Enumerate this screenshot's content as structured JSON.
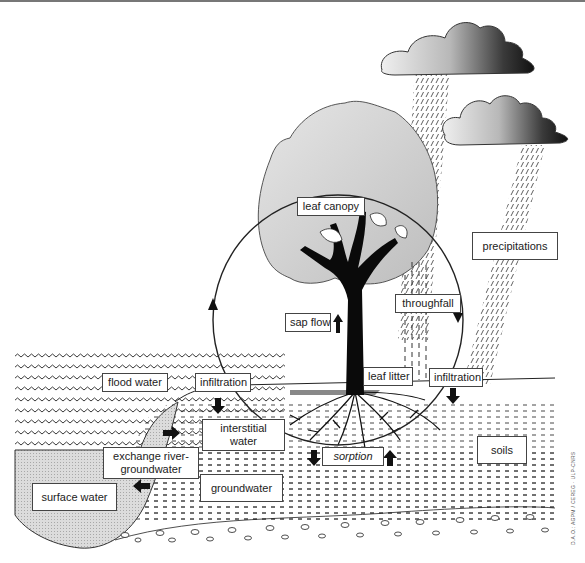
{
  "diagram": {
    "colors": {
      "ink": "#111111",
      "canopy_gray": "#d6d6d6",
      "surface_water_gray": "#d8d8d8",
      "cloud_light": "#e0e0e0",
      "cloud_dark": "#2a2a2a",
      "background": "#ffffff"
    },
    "labels": {
      "leaf_canopy": "leaf canopy",
      "precipitations": "precipitations",
      "throughfall": "throughfall",
      "sap_flow": "sap flow",
      "flood_water": "flood water",
      "infiltration_left": "infiltration",
      "infiltration_right": "infiltration",
      "leaf_litter": "leaf litter",
      "interstitial_water": "interstitial water",
      "exchange_river_groundwater": "exchange river-groundwater",
      "sorption": "sorption",
      "soils": "soils",
      "surface_water": "surface water",
      "groundwater": "groundwater"
    },
    "credit": "D.A.O.: AGPM / CEREG · ULP-CNRS",
    "icons": {
      "arrows": [
        "arrow-up sap flow",
        "arrow-down infiltration left",
        "arrow-down infiltration right",
        "arrow-right exchange",
        "arrow-left exchange",
        "arrow-down sorption",
        "arrow-up sorption",
        "cycle-arrow-up left",
        "cycle-arrow-down right"
      ],
      "clouds": 2,
      "tree": 1
    }
  }
}
